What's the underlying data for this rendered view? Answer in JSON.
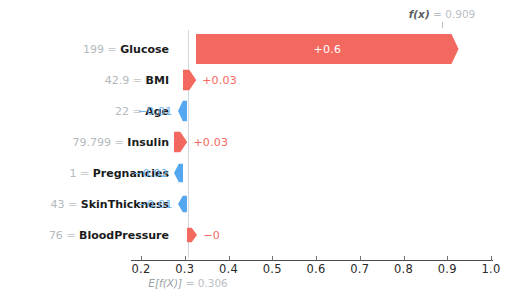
{
  "chart_data": {
    "type": "bar",
    "plot_kind": "shap-waterfall",
    "title": "",
    "xlabel": "",
    "ylabel": "",
    "base_value_label": "E[f(X)]",
    "base_value_eq": "=",
    "base_value": "0.306",
    "base_value_num": 0.306,
    "output_label": "f(x)",
    "output_eq": "=",
    "output_value": "0.909",
    "output_value_num": 0.909,
    "xlim": [
      0.15,
      1.04
    ],
    "xticks": [
      0.2,
      0.3,
      0.4,
      0.5,
      0.6,
      0.7,
      0.8,
      0.9,
      1.0
    ],
    "xticklabels": [
      "0.2",
      "0.3",
      "0.4",
      "0.5",
      "0.6",
      "0.7",
      "0.8",
      "0.9",
      "1.0"
    ],
    "grid": false,
    "legend": "none",
    "positive_color": "#f4695f",
    "negative_color": "#55a8f0",
    "categories": [
      "199 = Glucose",
      "42.9 = BMI",
      "22 = Age",
      "79.799 = Insulin",
      "1 = Pregnancies",
      "43 = SkinThickness",
      "76 = BloodPressure"
    ],
    "values": [
      0.6,
      0.03,
      -0.01,
      0.03,
      -0.02,
      -0.01,
      -0.0
    ],
    "features": [
      {
        "value": "199",
        "eq": "=",
        "name": "Glucose",
        "shap_label": "+0.6",
        "shap": 0.6,
        "sign": "pos",
        "label_inside": true
      },
      {
        "value": "42.9",
        "eq": "=",
        "name": "BMI",
        "shap_label": "+0.03",
        "shap": 0.03,
        "sign": "pos",
        "label_inside": false
      },
      {
        "value": "22",
        "eq": "=",
        "name": "Age",
        "shap_label": "−0.01",
        "shap": -0.01,
        "sign": "neg",
        "label_inside": false
      },
      {
        "value": "79.799",
        "eq": "=",
        "name": "Insulin",
        "shap_label": "+0.03",
        "shap": 0.03,
        "sign": "pos",
        "label_inside": false
      },
      {
        "value": "1",
        "eq": "=",
        "name": "Pregnancies",
        "shap_label": "−0.02",
        "shap": -0.02,
        "sign": "neg",
        "label_inside": false
      },
      {
        "value": "43",
        "eq": "=",
        "name": "SkinThickness",
        "shap_label": "−0.01",
        "shap": -0.01,
        "sign": "neg",
        "label_inside": false
      },
      {
        "value": "76",
        "eq": "=",
        "name": "BloodPressure",
        "shap_label": "−0",
        "shap": -0.0,
        "sign": "neg",
        "label_inside": false
      }
    ]
  }
}
